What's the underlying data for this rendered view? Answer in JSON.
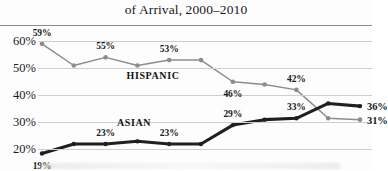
{
  "chart_title": "of Arrival, 2000–2010",
  "axis": {
    "y_ticks": [
      "20%",
      "30%",
      "40%",
      "50%",
      "60%"
    ],
    "y_tick_values": [
      20,
      30,
      40,
      50,
      60
    ]
  },
  "series_labels": {
    "hispanic": "HISPANIC",
    "asian": "ASIAN"
  },
  "end_labels": {
    "asian": "36%",
    "hispanic": "31%"
  },
  "point_labels": {
    "hispanic": [
      "59%",
      "55%",
      "53%",
      "46%",
      "42%"
    ],
    "asian": [
      "19%",
      "23%",
      "23%",
      "29%",
      "33%"
    ]
  },
  "colors": {
    "hispanic_line": "#8c8c8c",
    "asian_line": "#1f1f1f",
    "gridline": "#cfcfcf",
    "text": "#1a1a1a",
    "background": "#fdfdfd"
  },
  "chart_data": {
    "type": "line",
    "title": "of Arrival, 2000–2010",
    "xlabel": "",
    "ylabel": "",
    "ylim": [
      15,
      63
    ],
    "grid": true,
    "legend": "inline-series-labels",
    "x": [
      2000,
      2001,
      2002,
      2003,
      2004,
      2005,
      2006,
      2007,
      2008,
      2009,
      2010
    ],
    "categories": [
      "2000",
      "2001",
      "2002",
      "2003",
      "2004",
      "2005",
      "2006",
      "2007",
      "2008",
      "2009",
      "2010"
    ],
    "series": [
      {
        "name": "HISPANIC",
        "color": "#8c8c8c",
        "values": [
          59,
          51,
          54,
          51,
          53,
          53,
          45,
          44,
          42,
          31.5,
          31
        ],
        "labeled_points": [
          {
            "index": 0,
            "text": "59%",
            "position": "above"
          },
          {
            "index": 2,
            "text": "55%",
            "position": "above"
          },
          {
            "index": 4,
            "text": "53%",
            "position": "above"
          },
          {
            "index": 6,
            "text": "46%",
            "position": "below"
          },
          {
            "index": 8,
            "text": "42%",
            "position": "above"
          },
          {
            "index": 10,
            "text": "31%",
            "position": "right"
          }
        ]
      },
      {
        "name": "ASIAN",
        "color": "#1f1f1f",
        "values": [
          18.5,
          22,
          22,
          23,
          22,
          22,
          29,
          31,
          31.5,
          37,
          36
        ],
        "labeled_points": [
          {
            "index": 0,
            "text": "19%",
            "position": "below"
          },
          {
            "index": 2,
            "text": "23%",
            "position": "above"
          },
          {
            "index": 4,
            "text": "23%",
            "position": "above"
          },
          {
            "index": 6,
            "text": "29%",
            "position": "above"
          },
          {
            "index": 8,
            "text": "33%",
            "position": "above"
          },
          {
            "index": 10,
            "text": "36%",
            "position": "right"
          }
        ]
      }
    ]
  }
}
